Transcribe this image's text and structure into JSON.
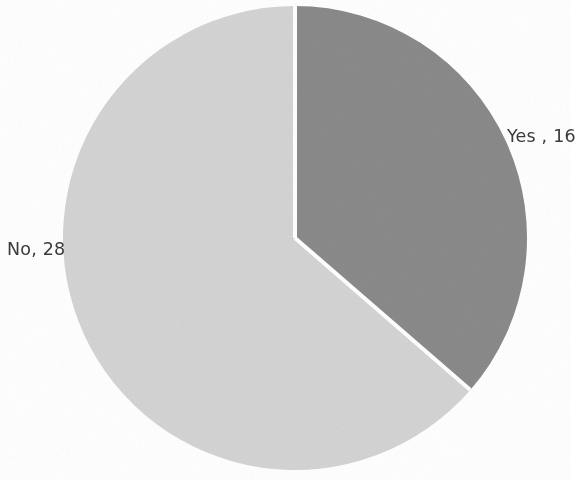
{
  "chart_data": {
    "type": "pie",
    "title": "",
    "subtitle": "",
    "xlabel": "",
    "ylabel": "",
    "categories": [
      "Yes",
      "No"
    ],
    "values": [
      16,
      28
    ],
    "total": 44,
    "labels": [
      "Yes , 16",
      "No, 28"
    ],
    "slices": [
      {
        "name": "Yes",
        "value": 16,
        "label": "Yes , 16",
        "percent": 36.4,
        "start_angle_deg": 0,
        "end_angle_deg": 130.9,
        "color": "#8a8a8a"
      },
      {
        "name": "No",
        "value": 28,
        "label": "No, 28",
        "percent": 63.6,
        "start_angle_deg": 130.9,
        "end_angle_deg": 360,
        "color": "#d4d4d4"
      }
    ],
    "legend": null,
    "legend_position": "none",
    "grid": false,
    "data_labels": true,
    "start_angle_deg": 0,
    "direction": "clockwise"
  },
  "style": {
    "background": "#ffffff",
    "text_color": "#3a3a3a",
    "separator_color": "#ffffff",
    "separator_width": 4,
    "slice_yes_color": "#8a8a8a",
    "slice_no_color": "#d4d4d4"
  },
  "geometry": {
    "center_x": 295,
    "center_y": 238,
    "radius": 232
  },
  "labels": {
    "yes": "Yes , 16",
    "no": "No, 28"
  }
}
